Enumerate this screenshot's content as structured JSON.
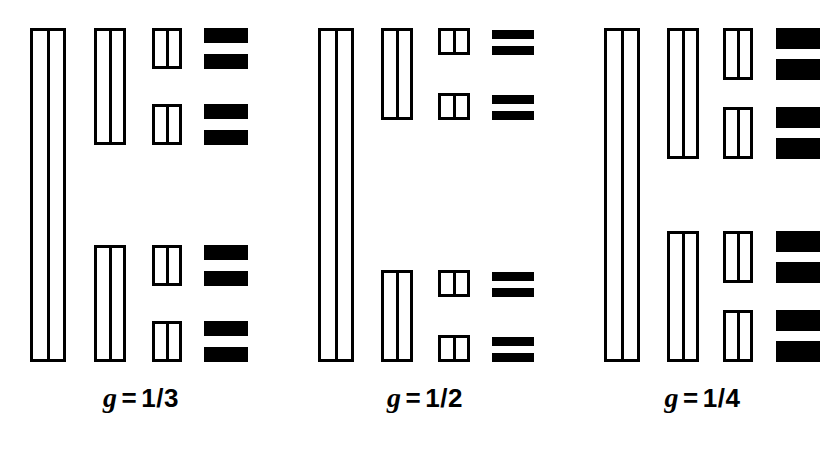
{
  "figure": {
    "type": "recursive-cantor-construction",
    "background_color": "#ffffff",
    "ink_color": "#000000",
    "width": 837,
    "height": 454
  },
  "panels": [
    {
      "id": "panel-g-1-3",
      "label": {
        "symbol": "g",
        "relation": "=",
        "value": "1/3",
        "full": "g = 1/3"
      },
      "gap_ratio": "1/3",
      "left": 0,
      "width": 282,
      "label_left": 0,
      "label_width": 282,
      "label_top": 382,
      "stages": [
        {
          "stage": 1,
          "x": 30,
          "width": 36,
          "segments": [
            {
              "top": 28,
              "height": 334
            }
          ]
        },
        {
          "stage": 2,
          "x": 94,
          "width": 32,
          "segments": [
            {
              "top": 28,
              "height": 117
            },
            {
              "top": 245,
              "height": 117
            }
          ]
        },
        {
          "stage": 3,
          "x": 152,
          "width": 30,
          "segments": [
            {
              "top": 28,
              "height": 41
            },
            {
              "top": 104,
              "height": 41
            },
            {
              "top": 245,
              "height": 41
            },
            {
              "top": 321,
              "height": 41
            }
          ]
        },
        {
          "stage": 4,
          "x": 204,
          "width": 44,
          "solid": true,
          "segments": [
            {
              "top": 28,
              "height": 15
            },
            {
              "top": 54,
              "height": 15
            },
            {
              "top": 104,
              "height": 15
            },
            {
              "top": 130,
              "height": 15
            },
            {
              "top": 245,
              "height": 15
            },
            {
              "top": 271,
              "height": 15
            },
            {
              "top": 321,
              "height": 15
            },
            {
              "top": 347,
              "height": 15
            }
          ]
        }
      ]
    },
    {
      "id": "panel-g-1-2",
      "label": {
        "symbol": "g",
        "relation": "=",
        "value": "1/2",
        "full": "g = 1/2"
      },
      "gap_ratio": "1/2",
      "left": 282,
      "width": 286,
      "label_left": 282,
      "label_width": 286,
      "label_top": 382,
      "stages": [
        {
          "stage": 1,
          "x": 318,
          "width": 36,
          "segments": [
            {
              "top": 28,
              "height": 334
            }
          ]
        },
        {
          "stage": 2,
          "x": 381,
          "width": 32,
          "segments": [
            {
              "top": 28,
              "height": 92
            },
            {
              "top": 270,
              "height": 92
            }
          ]
        },
        {
          "stage": 3,
          "x": 438,
          "width": 32,
          "segments": [
            {
              "top": 28,
              "height": 27
            },
            {
              "top": 93,
              "height": 27
            },
            {
              "top": 270,
              "height": 27
            },
            {
              "top": 335,
              "height": 27
            }
          ]
        },
        {
          "stage": 4,
          "x": 492,
          "width": 42,
          "solid": true,
          "segments": [
            {
              "top": 30,
              "height": 9
            },
            {
              "top": 46,
              "height": 9
            },
            {
              "top": 95,
              "height": 9
            },
            {
              "top": 111,
              "height": 9
            },
            {
              "top": 272,
              "height": 9
            },
            {
              "top": 288,
              "height": 9
            },
            {
              "top": 337,
              "height": 9
            },
            {
              "top": 353,
              "height": 9
            }
          ]
        }
      ]
    },
    {
      "id": "panel-g-1-4",
      "label": {
        "symbol": "g",
        "relation": "=",
        "value": "1/4",
        "full": "g = 1/4"
      },
      "gap_ratio": "1/4",
      "left": 568,
      "width": 269,
      "label_left": 568,
      "label_width": 269,
      "label_top": 382,
      "stages": [
        {
          "stage": 1,
          "x": 604,
          "width": 36,
          "segments": [
            {
              "top": 28,
              "height": 334
            }
          ]
        },
        {
          "stage": 2,
          "x": 667,
          "width": 32,
          "segments": [
            {
              "top": 28,
              "height": 131
            },
            {
              "top": 231,
              "height": 131
            }
          ]
        },
        {
          "stage": 3,
          "x": 723,
          "width": 30,
          "segments": [
            {
              "top": 28,
              "height": 52
            },
            {
              "top": 107,
              "height": 52
            },
            {
              "top": 231,
              "height": 52
            },
            {
              "top": 310,
              "height": 52
            }
          ]
        },
        {
          "stage": 4,
          "x": 776,
          "width": 44,
          "solid": true,
          "segments": [
            {
              "top": 28,
              "height": 21
            },
            {
              "top": 59,
              "height": 21
            },
            {
              "top": 107,
              "height": 21
            },
            {
              "top": 138,
              "height": 21
            },
            {
              "top": 231,
              "height": 21
            },
            {
              "top": 262,
              "height": 21
            },
            {
              "top": 310,
              "height": 21
            },
            {
              "top": 341,
              "height": 21
            }
          ]
        }
      ]
    }
  ]
}
